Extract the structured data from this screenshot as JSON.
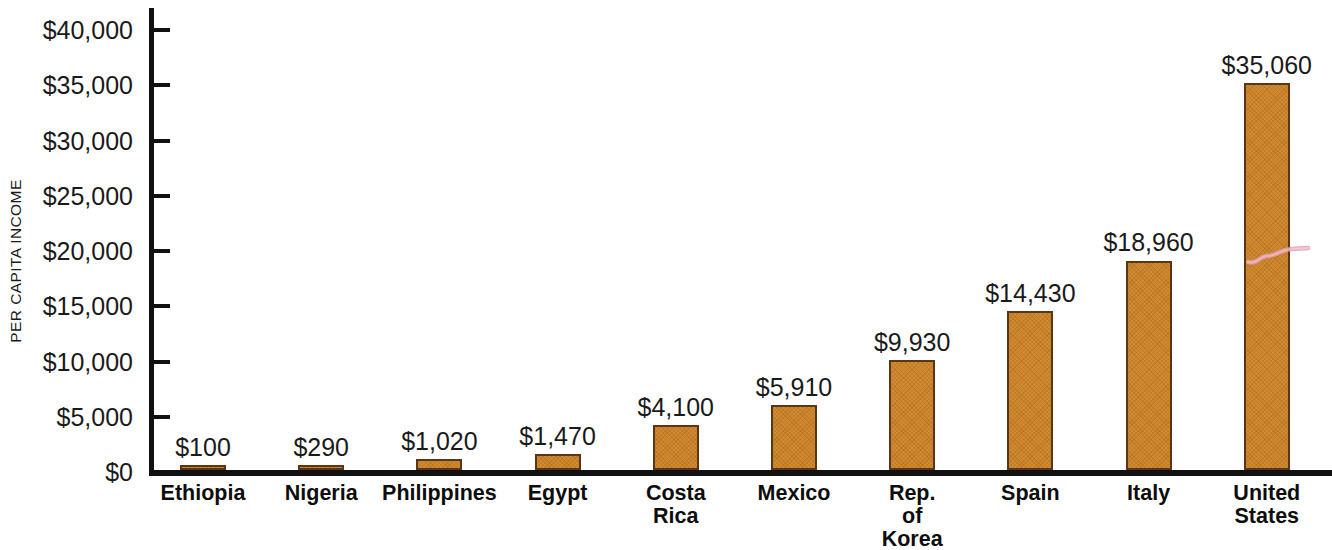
{
  "chart_data": {
    "type": "bar",
    "title": "",
    "xlabel": "",
    "ylabel": "PER CAPITA INCOME",
    "ylim": [
      0,
      40000
    ],
    "ytick_step": 5000,
    "grid": false,
    "legend": null,
    "value_label_prefix": "$",
    "categories": [
      "Ethiopia",
      "Nigeria",
      "Philippines",
      "Egypt",
      "Costa\nRica",
      "Mexico",
      "Rep. of\nKorea",
      "Spain",
      "Italy",
      "United\nStates"
    ],
    "values": [
      100,
      290,
      1020,
      1470,
      4100,
      5910,
      9930,
      14430,
      18960,
      35060
    ],
    "value_labels": [
      "$100",
      "$290",
      "$1,020",
      "$1,470",
      "$4,100",
      "$5,910",
      "$9,930",
      "$14,430",
      "$18,960",
      "$35,060"
    ],
    "ytick_labels": [
      "$0",
      "$5,000",
      "$10,000",
      "$15,000",
      "$20,000",
      "$25,000",
      "$30,000",
      "$35,000",
      "$40,000"
    ],
    "ytick_values": [
      0,
      5000,
      10000,
      15000,
      20000,
      25000,
      30000,
      35000,
      40000
    ],
    "colors": {
      "bar_fill": "#d18a2f",
      "bar_border": "#5a3516",
      "axis": "#111111",
      "text": "#1a1a1a",
      "background": "#ffffff",
      "artifact": "#e8a0b4"
    }
  }
}
